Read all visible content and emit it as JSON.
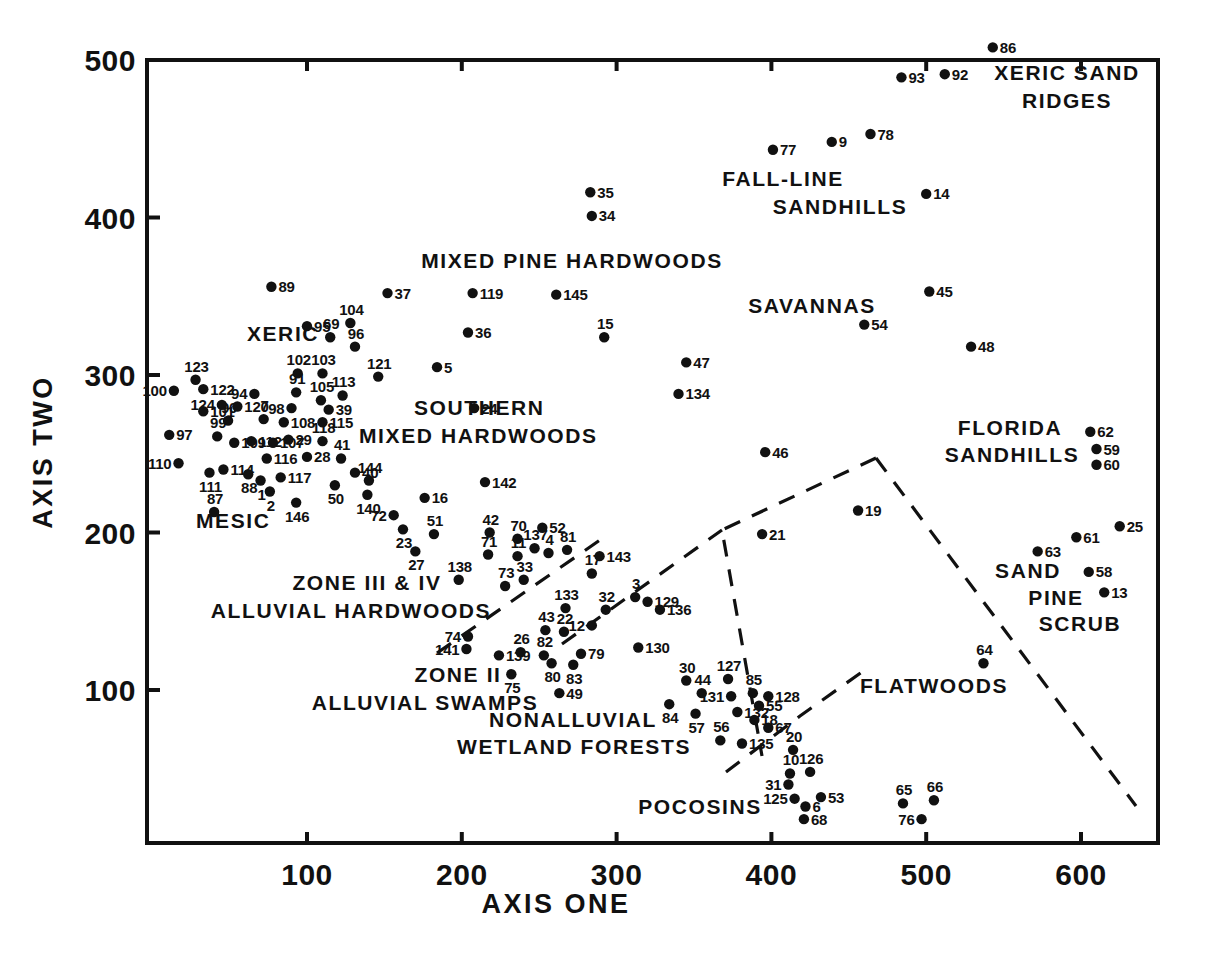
{
  "chart_data": {
    "type": "scatter",
    "title": "",
    "xlabel": "AXIS ONE",
    "ylabel": "AXIS TWO",
    "xlim": [
      0,
      640
    ],
    "ylim": [
      10,
      520
    ],
    "xticks": [
      100,
      200,
      300,
      400,
      500,
      600
    ],
    "yticks": [
      100,
      200,
      300,
      400,
      500
    ],
    "xticklabels": [
      "100",
      "200",
      "300",
      "400",
      "500",
      "600"
    ],
    "yticklabels": [
      "100",
      "200",
      "300",
      "400",
      "500"
    ],
    "grid": false,
    "legend": "none",
    "marker_color": "#111111",
    "points": [
      {
        "label": "86",
        "x": 543,
        "y": 508,
        "lp": "right"
      },
      {
        "label": "93",
        "x": 484,
        "y": 489,
        "lp": "right"
      },
      {
        "label": "92",
        "x": 512,
        "y": 491,
        "lp": "right"
      },
      {
        "label": "77",
        "x": 401,
        "y": 443,
        "lp": "right"
      },
      {
        "label": "9",
        "x": 439,
        "y": 448,
        "lp": "right"
      },
      {
        "label": "78",
        "x": 464,
        "y": 453,
        "lp": "right"
      },
      {
        "label": "14",
        "x": 500,
        "y": 415,
        "lp": "right"
      },
      {
        "label": "35",
        "x": 283,
        "y": 416,
        "lp": "right"
      },
      {
        "label": "34",
        "x": 284,
        "y": 401,
        "lp": "right"
      },
      {
        "label": "45",
        "x": 502,
        "y": 353,
        "lp": "right"
      },
      {
        "label": "54",
        "x": 460,
        "y": 332,
        "lp": "right"
      },
      {
        "label": "48",
        "x": 529,
        "y": 318,
        "lp": "right"
      },
      {
        "label": "89",
        "x": 77,
        "y": 356,
        "lp": "right"
      },
      {
        "label": "37",
        "x": 152,
        "y": 352,
        "lp": "right"
      },
      {
        "label": "119",
        "x": 207,
        "y": 352,
        "lp": "right"
      },
      {
        "label": "145",
        "x": 261,
        "y": 351,
        "lp": "right"
      },
      {
        "label": "36",
        "x": 204,
        "y": 327,
        "lp": "right"
      },
      {
        "label": "95",
        "x": 100,
        "y": 331,
        "lp": "right"
      },
      {
        "label": "104",
        "x": 128,
        "y": 333,
        "lp": "above"
      },
      {
        "label": "69",
        "x": 115,
        "y": 324,
        "lp": "above"
      },
      {
        "label": "96",
        "x": 131,
        "y": 318,
        "lp": "above"
      },
      {
        "label": "121",
        "x": 146,
        "y": 299,
        "lp": "above"
      },
      {
        "label": "5",
        "x": 184,
        "y": 305,
        "lp": "right"
      },
      {
        "label": "15",
        "x": 292,
        "y": 324,
        "lp": "above"
      },
      {
        "label": "47",
        "x": 345,
        "y": 308,
        "lp": "right"
      },
      {
        "label": "134",
        "x": 340,
        "y": 288,
        "lp": "right"
      },
      {
        "label": "123",
        "x": 28,
        "y": 297,
        "lp": "above"
      },
      {
        "label": "102",
        "x": 94,
        "y": 301,
        "lp": "above"
      },
      {
        "label": "103",
        "x": 110,
        "y": 301,
        "lp": "above"
      },
      {
        "label": "100",
        "x": 14,
        "y": 290,
        "lp": "left"
      },
      {
        "label": "122",
        "x": 33,
        "y": 291,
        "lp": "right"
      },
      {
        "label": "94",
        "x": 66,
        "y": 288,
        "lp": "left"
      },
      {
        "label": "91",
        "x": 93,
        "y": 289,
        "lp": "above"
      },
      {
        "label": "105",
        "x": 109,
        "y": 284,
        "lp": "above"
      },
      {
        "label": "113",
        "x": 123,
        "y": 287,
        "lp": "above"
      },
      {
        "label": "124",
        "x": 45,
        "y": 281,
        "lp": "left"
      },
      {
        "label": "120",
        "x": 55,
        "y": 280,
        "lp": "right"
      },
      {
        "label": "98",
        "x": 90,
        "y": 279,
        "lp": "left"
      },
      {
        "label": "39",
        "x": 114,
        "y": 278,
        "lp": "right"
      },
      {
        "label": "101",
        "x": 33,
        "y": 277,
        "lp": "right"
      },
      {
        "label": "90",
        "x": 49,
        "y": 271,
        "lp": "above"
      },
      {
        "label": "7",
        "x": 72,
        "y": 272,
        "lp": "above"
      },
      {
        "label": "108",
        "x": 85,
        "y": 270,
        "lp": "right"
      },
      {
        "label": "115",
        "x": 110,
        "y": 270,
        "lp": "right"
      },
      {
        "label": "97",
        "x": 11,
        "y": 262,
        "lp": "right"
      },
      {
        "label": "99",
        "x": 42,
        "y": 261,
        "lp": "above"
      },
      {
        "label": "109",
        "x": 53,
        "y": 257,
        "lp": "right"
      },
      {
        "label": "112",
        "x": 64,
        "y": 258,
        "lp": "right"
      },
      {
        "label": "107",
        "x": 78,
        "y": 257,
        "lp": "right"
      },
      {
        "label": "29",
        "x": 88,
        "y": 259,
        "lp": "right"
      },
      {
        "label": "118",
        "x": 110,
        "y": 258,
        "lp": "above"
      },
      {
        "label": "110",
        "x": 17,
        "y": 244,
        "lp": "left"
      },
      {
        "label": "116",
        "x": 74,
        "y": 247,
        "lp": "right"
      },
      {
        "label": "28",
        "x": 100,
        "y": 248,
        "lp": "right"
      },
      {
        "label": "41",
        "x": 122,
        "y": 247,
        "lp": "above"
      },
      {
        "label": "111",
        "x": 37,
        "y": 238,
        "lp": "below"
      },
      {
        "label": "114",
        "x": 46,
        "y": 240,
        "lp": "right"
      },
      {
        "label": "88",
        "x": 62,
        "y": 237,
        "lp": "below"
      },
      {
        "label": "1",
        "x": 70,
        "y": 233,
        "lp": "below"
      },
      {
        "label": "117",
        "x": 83,
        "y": 235,
        "lp": "right"
      },
      {
        "label": "40",
        "x": 131,
        "y": 238,
        "lp": "right"
      },
      {
        "label": "144",
        "x": 140,
        "y": 233,
        "lp": "above"
      },
      {
        "label": "50",
        "x": 118,
        "y": 230,
        "lp": "below"
      },
      {
        "label": "2",
        "x": 76,
        "y": 226,
        "lp": "below"
      },
      {
        "label": "140",
        "x": 139,
        "y": 224,
        "lp": "below"
      },
      {
        "label": "146",
        "x": 93,
        "y": 219,
        "lp": "below"
      },
      {
        "label": "16",
        "x": 176,
        "y": 222,
        "lp": "right"
      },
      {
        "label": "142",
        "x": 215,
        "y": 232,
        "lp": "right"
      },
      {
        "label": "24",
        "x": 208,
        "y": 279,
        "lp": "right"
      },
      {
        "label": "87",
        "x": 40,
        "y": 213,
        "lp": "above"
      },
      {
        "label": "72",
        "x": 156,
        "y": 211,
        "lp": "left"
      },
      {
        "label": "23",
        "x": 162,
        "y": 202,
        "lp": "below"
      },
      {
        "label": "51",
        "x": 182,
        "y": 199,
        "lp": "above"
      },
      {
        "label": "27",
        "x": 170,
        "y": 188,
        "lp": "below"
      },
      {
        "label": "42",
        "x": 218,
        "y": 200,
        "lp": "above"
      },
      {
        "label": "70",
        "x": 236,
        "y": 196,
        "lp": "above"
      },
      {
        "label": "52",
        "x": 252,
        "y": 203,
        "lp": "right"
      },
      {
        "label": "71",
        "x": 217,
        "y": 186,
        "lp": "above"
      },
      {
        "label": "11",
        "x": 236,
        "y": 185,
        "lp": "above"
      },
      {
        "label": "137",
        "x": 247,
        "y": 190,
        "lp": "above"
      },
      {
        "label": "4",
        "x": 256,
        "y": 187,
        "lp": "above"
      },
      {
        "label": "81",
        "x": 268,
        "y": 189,
        "lp": "above"
      },
      {
        "label": "143",
        "x": 289,
        "y": 185,
        "lp": "right"
      },
      {
        "label": "138",
        "x": 198,
        "y": 170,
        "lp": "above"
      },
      {
        "label": "73",
        "x": 228,
        "y": 166,
        "lp": "above"
      },
      {
        "label": "33",
        "x": 240,
        "y": 170,
        "lp": "above"
      },
      {
        "label": "17",
        "x": 284,
        "y": 174,
        "lp": "above"
      },
      {
        "label": "3",
        "x": 312,
        "y": 159,
        "lp": "above"
      },
      {
        "label": "129",
        "x": 320,
        "y": 156,
        "lp": "right"
      },
      {
        "label": "133",
        "x": 267,
        "y": 152,
        "lp": "above"
      },
      {
        "label": "32",
        "x": 293,
        "y": 151,
        "lp": "above"
      },
      {
        "label": "136",
        "x": 328,
        "y": 151,
        "lp": "right"
      },
      {
        "label": "12",
        "x": 284,
        "y": 141,
        "lp": "left"
      },
      {
        "label": "43",
        "x": 254,
        "y": 138,
        "lp": "above"
      },
      {
        "label": "22",
        "x": 266,
        "y": 137,
        "lp": "above"
      },
      {
        "label": "130",
        "x": 314,
        "y": 127,
        "lp": "right"
      },
      {
        "label": "74",
        "x": 204,
        "y": 134,
        "lp": "left"
      },
      {
        "label": "141",
        "x": 203,
        "y": 126,
        "lp": "left"
      },
      {
        "label": "139",
        "x": 224,
        "y": 122,
        "lp": "right"
      },
      {
        "label": "26",
        "x": 238,
        "y": 124,
        "lp": "above"
      },
      {
        "label": "82",
        "x": 253,
        "y": 122,
        "lp": "above"
      },
      {
        "label": "80",
        "x": 258,
        "y": 117,
        "lp": "below"
      },
      {
        "label": "79",
        "x": 277,
        "y": 123,
        "lp": "right"
      },
      {
        "label": "83",
        "x": 272,
        "y": 116,
        "lp": "below"
      },
      {
        "label": "75",
        "x": 232,
        "y": 110,
        "lp": "below"
      },
      {
        "label": "49",
        "x": 263,
        "y": 98,
        "lp": "right"
      },
      {
        "label": "30",
        "x": 345,
        "y": 106,
        "lp": "above"
      },
      {
        "label": "127",
        "x": 372,
        "y": 107,
        "lp": "above"
      },
      {
        "label": "44",
        "x": 355,
        "y": 98,
        "lp": "above"
      },
      {
        "label": "131",
        "x": 374,
        "y": 96,
        "lp": "left"
      },
      {
        "label": "85",
        "x": 388,
        "y": 98,
        "lp": "above"
      },
      {
        "label": "128",
        "x": 398,
        "y": 96,
        "lp": "right"
      },
      {
        "label": "84",
        "x": 334,
        "y": 91,
        "lp": "below"
      },
      {
        "label": "55",
        "x": 392,
        "y": 90,
        "lp": "right"
      },
      {
        "label": "57",
        "x": 351,
        "y": 85,
        "lp": "below"
      },
      {
        "label": "132",
        "x": 378,
        "y": 86,
        "lp": "right"
      },
      {
        "label": "18",
        "x": 389,
        "y": 81,
        "lp": "right"
      },
      {
        "label": "67",
        "x": 398,
        "y": 76,
        "lp": "right"
      },
      {
        "label": "56",
        "x": 367,
        "y": 68,
        "lp": "above"
      },
      {
        "label": "135",
        "x": 381,
        "y": 66,
        "lp": "right"
      },
      {
        "label": "64",
        "x": 537,
        "y": 117,
        "lp": "above"
      },
      {
        "label": "19",
        "x": 456,
        "y": 214,
        "lp": "right"
      },
      {
        "label": "21",
        "x": 394,
        "y": 199,
        "lp": "right"
      },
      {
        "label": "46",
        "x": 396,
        "y": 251,
        "lp": "right"
      },
      {
        "label": "62",
        "x": 606,
        "y": 264,
        "lp": "right"
      },
      {
        "label": "59",
        "x": 610,
        "y": 253,
        "lp": "right"
      },
      {
        "label": "60",
        "x": 610,
        "y": 243,
        "lp": "right"
      },
      {
        "label": "25",
        "x": 625,
        "y": 204,
        "lp": "right"
      },
      {
        "label": "61",
        "x": 597,
        "y": 197,
        "lp": "right"
      },
      {
        "label": "63",
        "x": 572,
        "y": 188,
        "lp": "right"
      },
      {
        "label": "58",
        "x": 605,
        "y": 175,
        "lp": "right"
      },
      {
        "label": "13",
        "x": 615,
        "y": 162,
        "lp": "right"
      },
      {
        "label": "20",
        "x": 414,
        "y": 62,
        "lp": "above"
      },
      {
        "label": "10",
        "x": 412,
        "y": 47,
        "lp": "above"
      },
      {
        "label": "126",
        "x": 425,
        "y": 48,
        "lp": "above"
      },
      {
        "label": "31",
        "x": 411,
        "y": 40,
        "lp": "left"
      },
      {
        "label": "125",
        "x": 415,
        "y": 31,
        "lp": "left"
      },
      {
        "label": "53",
        "x": 432,
        "y": 32,
        "lp": "right"
      },
      {
        "label": "6",
        "x": 422,
        "y": 26,
        "lp": "right"
      },
      {
        "label": "68",
        "x": 421,
        "y": 18,
        "lp": "right"
      },
      {
        "label": "65",
        "x": 485,
        "y": 28,
        "lp": "above"
      },
      {
        "label": "66",
        "x": 505,
        "y": 30,
        "lp": "above"
      },
      {
        "label": "76",
        "x": 497,
        "y": 18,
        "lp": "left"
      }
    ],
    "annotations": [
      {
        "text": "XERIC SAND",
        "x": 1067,
        "y": 80,
        "anchor": "middle"
      },
      {
        "text": "RIDGES",
        "x": 1067,
        "y": 108,
        "anchor": "middle"
      },
      {
        "text": "FALL-LINE",
        "x": 783,
        "y": 186,
        "anchor": "middle"
      },
      {
        "text": "SANDHILLS",
        "x": 840,
        "y": 214,
        "anchor": "middle"
      },
      {
        "text": "MIXED PINE HARDWOODS",
        "x": 572,
        "y": 268,
        "anchor": "middle"
      },
      {
        "text": "SAVANNAS",
        "x": 812,
        "y": 313,
        "anchor": "middle"
      },
      {
        "text": "XERIC",
        "x": 283,
        "y": 341,
        "anchor": "middle"
      },
      {
        "text": "SOUTHERN",
        "x": 414,
        "y": 415,
        "anchor": "start"
      },
      {
        "text": "MIXED HARDWOODS",
        "x": 359,
        "y": 443,
        "anchor": "start"
      },
      {
        "text": "FLORIDA",
        "x": 1010,
        "y": 435,
        "anchor": "middle"
      },
      {
        "text": "SANDHILLS",
        "x": 1012,
        "y": 462,
        "anchor": "middle"
      },
      {
        "text": "MESIC",
        "x": 196,
        "y": 528,
        "anchor": "start"
      },
      {
        "text": "SAND",
        "x": 1028,
        "y": 578,
        "anchor": "middle"
      },
      {
        "text": "ZONE III & IV",
        "x": 367,
        "y": 590,
        "anchor": "middle"
      },
      {
        "text": "PINE",
        "x": 1056,
        "y": 605,
        "anchor": "middle"
      },
      {
        "text": "ALLUVIAL HARDWOODS",
        "x": 351,
        "y": 618,
        "anchor": "middle"
      },
      {
        "text": "SCRUB",
        "x": 1080,
        "y": 631,
        "anchor": "middle"
      },
      {
        "text": "ZONE II",
        "x": 458,
        "y": 682,
        "anchor": "middle"
      },
      {
        "text": "FLATWOODS",
        "x": 934,
        "y": 693,
        "anchor": "middle"
      },
      {
        "text": "ALLUVIAL SWAMPS",
        "x": 425,
        "y": 710,
        "anchor": "middle"
      },
      {
        "text": "NONALLUVIAL",
        "x": 573,
        "y": 727,
        "anchor": "middle"
      },
      {
        "text": "WETLAND FORESTS",
        "x": 574,
        "y": 754,
        "anchor": "middle"
      },
      {
        "text": "POCOSINS",
        "x": 700,
        "y": 814,
        "anchor": "middle"
      }
    ],
    "boundaries": [
      {
        "name": "flatwoods-polygon",
        "points": "876,458 722,530 722,530 762,756 762,756"
      },
      {
        "name": "flatwoods-right-edge",
        "points": "876,458 1136,806"
      },
      {
        "name": "pocosin-divider",
        "points": "562,644 722,530"
      },
      {
        "name": "pocosin-lower",
        "points": "726,772 800,716 862,672"
      },
      {
        "name": "alluvial-divider",
        "points": "437,653 600,540"
      }
    ]
  },
  "axes": {
    "x_title": "AXIS ONE",
    "y_title": "AXIS TWO"
  }
}
